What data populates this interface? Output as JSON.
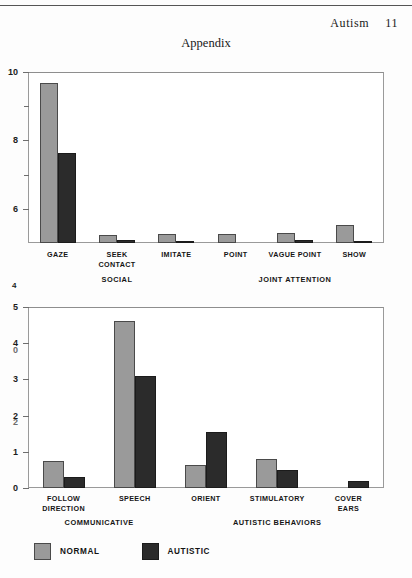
{
  "page": {
    "running_head_title": "Autism",
    "page_number": "11",
    "section_title": "Appendix",
    "stray_marginal_number": "4"
  },
  "legend": {
    "items": [
      {
        "label": "NORMAL",
        "color": "#9a9a9a"
      },
      {
        "label": "AUTISTIC",
        "color": "#2b2b2b"
      }
    ]
  },
  "chart_data": [
    {
      "type": "bar",
      "title": "",
      "xlabel": "",
      "ylabel": "",
      "ylim": [
        5,
        10
      ],
      "yticks": [
        6,
        8,
        10
      ],
      "ytick_labels": [
        "6",
        "8",
        "10"
      ],
      "minor_yticks": [
        7,
        9
      ],
      "grid": false,
      "legend_position": "bottom",
      "categories": [
        "GAZE",
        "SEEK CONTACT",
        "IMITATE",
        "POINT",
        "VAGUE POINT",
        "SHOW"
      ],
      "category_lines": [
        [
          "GAZE"
        ],
        [
          "SEEK",
          "CONTACT"
        ],
        [
          "IMITATE"
        ],
        [
          "POINT"
        ],
        [
          "VAGUE POINT"
        ],
        [
          "SHOW"
        ]
      ],
      "groups": [
        {
          "label": "SOCIAL",
          "categories": [
            "GAZE",
            "SEEK CONTACT",
            "IMITATE"
          ]
        },
        {
          "label": "JOINT ATTENTION",
          "categories": [
            "POINT",
            "VAGUE POINT",
            "SHOW"
          ]
        }
      ],
      "series": [
        {
          "name": "NORMAL",
          "color": "#9a9a9a",
          "values": [
            9.68,
            5.22,
            5.25,
            5.25,
            5.3,
            5.52
          ]
        },
        {
          "name": "AUTISTIC",
          "color": "#2b2b2b",
          "values": [
            7.62,
            5.08,
            5.07,
            5.0,
            5.08,
            5.07
          ]
        }
      ]
    },
    {
      "type": "bar",
      "title": "",
      "xlabel": "",
      "ylabel": "",
      "ylim": [
        0,
        5
      ],
      "yticks": [
        0,
        1,
        2,
        3,
        4,
        5
      ],
      "ytick_labels": [
        "0",
        "1",
        "2",
        "3",
        "4",
        "5"
      ],
      "ghost_ytick_labels": [
        "0",
        "2"
      ],
      "grid": false,
      "legend_position": "bottom",
      "categories": [
        "FOLLOW DIRECTION",
        "SPEECH",
        "ORIENT",
        "STIMULATORY",
        "COVER EARS"
      ],
      "category_lines": [
        [
          "FOLLOW",
          "DIRECTION"
        ],
        [
          "SPEECH"
        ],
        [
          "ORIENT"
        ],
        [
          "STIMULATORY"
        ],
        [
          "COVER",
          "EARS"
        ]
      ],
      "groups": [
        {
          "label": "COMMUNICATIVE",
          "categories": [
            "FOLLOW DIRECTION",
            "SPEECH"
          ]
        },
        {
          "label": "AUTISTIC BEHAVIORS",
          "categories": [
            "ORIENT",
            "STIMULATORY",
            "COVER EARS"
          ]
        }
      ],
      "series": [
        {
          "name": "NORMAL",
          "color": "#9a9a9a",
          "values": [
            0.74,
            4.6,
            0.63,
            0.8,
            0.0
          ]
        },
        {
          "name": "AUTISTIC",
          "color": "#2b2b2b",
          "values": [
            0.3,
            3.1,
            1.55,
            0.5,
            0.18
          ]
        }
      ]
    }
  ]
}
